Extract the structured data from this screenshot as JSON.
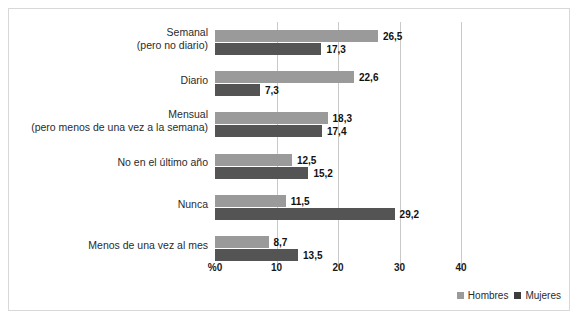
{
  "chart_data": {
    "type": "bar",
    "orientation": "horizontal",
    "title": "",
    "xlabel": "%",
    "ylabel": "",
    "xlim": [
      0,
      40
    ],
    "xticks": [
      0,
      10,
      20,
      30,
      40
    ],
    "xtick_labels": [
      "%0",
      "10",
      "20",
      "30",
      "40"
    ],
    "grid": true,
    "legend_position": "bottom-right",
    "categories": [
      "Semanal\n(pero no diario)",
      "Diario",
      "Mensual\n(pero menos de una vez a la semana)",
      "No en el último año",
      "Nunca",
      "Menos de una vez al mes"
    ],
    "category_lines": [
      [
        "Semanal",
        "(pero no diario)"
      ],
      [
        "Diario"
      ],
      [
        "Mensual",
        "(pero menos de una vez a la semana)"
      ],
      [
        "No en el último año"
      ],
      [
        "Nunca"
      ],
      [
        "Menos de una vez al mes"
      ]
    ],
    "series": [
      {
        "name": "Hombres",
        "color": "#9a9a9a",
        "values": [
          26.5,
          22.6,
          18.3,
          12.5,
          11.5,
          8.7
        ],
        "labels": [
          "26,5",
          "22,6",
          "18,3",
          "12,5",
          "11,5",
          "8,7"
        ]
      },
      {
        "name": "Mujeres",
        "color": "#545454",
        "values": [
          17.3,
          7.3,
          17.4,
          15.2,
          29.2,
          13.5
        ],
        "labels": [
          "17,3",
          "7,3",
          "17,4",
          "15,2",
          "29,2",
          "13,5"
        ]
      }
    ]
  },
  "legend": {
    "items": [
      {
        "label": "Hombres",
        "color": "#9a9a9a"
      },
      {
        "label": "Mujeres",
        "color": "#3d3d3d"
      }
    ]
  }
}
